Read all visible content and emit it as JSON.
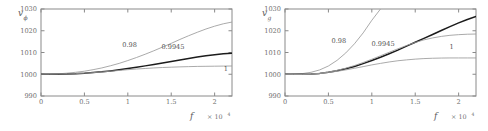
{
  "figure": {
    "panel_count": 2
  },
  "chart_data": [
    {
      "type": "line",
      "panel": "left",
      "title": "",
      "ylabel": "v",
      "ylabel_sub": "ϕ",
      "xlabel": "f",
      "x_exponent_prefix": "× 10",
      "x_exponent_power": "4",
      "xlim": [
        0,
        2.2
      ],
      "ylim": [
        990,
        1030
      ],
      "xticks": [
        0,
        0.5,
        1,
        1.5,
        2
      ],
      "xticklabels": [
        "0",
        "0.5",
        "1",
        "1.5",
        "2"
      ],
      "yticks": [
        990,
        1000,
        1010,
        1020,
        1030
      ],
      "yticklabels": [
        "990",
        "1000",
        "1010",
        "1020",
        "1030"
      ],
      "grid": false,
      "legend_position": "inline-annotations",
      "series": [
        {
          "name": "0.98",
          "style": "thin",
          "label": "0.98",
          "label_x": 1.02,
          "label_y": 1012.6,
          "x": [
            0,
            0.1,
            0.2,
            0.3,
            0.4,
            0.5,
            0.6,
            0.7,
            0.8,
            0.9,
            1.0,
            1.1,
            1.2,
            1.3,
            1.4,
            1.5,
            1.6,
            1.7,
            1.8,
            1.9,
            2.0,
            2.1,
            2.2
          ],
          "values": [
            1000.0,
            1000.05,
            1000.2,
            1000.5,
            1000.9,
            1001.4,
            1002.1,
            1002.9,
            1003.9,
            1005.0,
            1006.3,
            1007.7,
            1009.2,
            1010.8,
            1012.5,
            1014.2,
            1016.0,
            1017.7,
            1019.3,
            1020.8,
            1022.1,
            1023.2,
            1024.0
          ]
        },
        {
          "name": "0.9945",
          "style": "bold",
          "label": "0.9945",
          "label_x": 1.52,
          "label_y": 1011.6,
          "x": [
            0,
            0.1,
            0.2,
            0.3,
            0.4,
            0.5,
            0.6,
            0.7,
            0.8,
            0.9,
            1.0,
            1.1,
            1.2,
            1.3,
            1.4,
            1.5,
            1.6,
            1.7,
            1.8,
            1.9,
            2.0,
            2.1,
            2.2
          ],
          "values": [
            1000.0,
            1000.0,
            1000.05,
            1000.1,
            1000.25,
            1000.45,
            1000.75,
            1001.1,
            1001.55,
            1002.05,
            1002.6,
            1003.2,
            1003.85,
            1004.5,
            1005.2,
            1005.9,
            1006.6,
            1007.25,
            1007.9,
            1008.5,
            1009.0,
            1009.4,
            1009.7
          ]
        },
        {
          "name": "1",
          "style": "thin",
          "label": "1",
          "label_x": 2.13,
          "label_y": 1001.6,
          "x": [
            0,
            0.1,
            0.2,
            0.3,
            0.4,
            0.5,
            0.6,
            0.7,
            0.8,
            0.9,
            1.0,
            1.1,
            1.2,
            1.3,
            1.4,
            1.5,
            1.6,
            1.7,
            1.8,
            1.9,
            2.0,
            2.1,
            2.2
          ],
          "values": [
            1000.0,
            1000.0,
            1000.05,
            1000.15,
            1000.3,
            1000.5,
            1000.75,
            1001.05,
            1001.4,
            1001.75,
            1002.1,
            1002.4,
            1002.65,
            1002.9,
            1003.1,
            1003.25,
            1003.4,
            1003.5,
            1003.6,
            1003.65,
            1003.7,
            1003.75,
            1003.8
          ]
        }
      ]
    },
    {
      "type": "line",
      "panel": "right",
      "title": "",
      "ylabel": "v",
      "ylabel_sub": "g",
      "xlabel": "f",
      "x_exponent_prefix": "× 10",
      "x_exponent_power": "4",
      "xlim": [
        0,
        2.2
      ],
      "ylim": [
        990,
        1030
      ],
      "xticks": [
        0,
        0.5,
        1,
        1.5,
        2
      ],
      "xticklabels": [
        "0",
        "0.5",
        "1",
        "1.5",
        "2"
      ],
      "yticks": [
        990,
        1000,
        1010,
        1020,
        1030
      ],
      "yticklabels": [
        "990",
        "1000",
        "1010",
        "1020",
        "1030"
      ],
      "grid": false,
      "legend_position": "inline-annotations",
      "series": [
        {
          "name": "0.98",
          "style": "thin",
          "label": "0.98",
          "label_x": 0.62,
          "label_y": 1014.2,
          "x": [
            0,
            0.1,
            0.2,
            0.3,
            0.4,
            0.5,
            0.6,
            0.7,
            0.8,
            0.9,
            1.0,
            1.1,
            1.15
          ],
          "values": [
            1000.0,
            1000.05,
            1000.3,
            1000.9,
            1002.0,
            1003.8,
            1006.4,
            1009.8,
            1014.0,
            1019.0,
            1024.8,
            1030.0,
            1032.0
          ]
        },
        {
          "name": "0.9945",
          "style": "bold",
          "label": "0.9945",
          "label_x": 1.13,
          "label_y": 1012.8,
          "x": [
            0,
            0.1,
            0.2,
            0.3,
            0.4,
            0.5,
            0.6,
            0.7,
            0.8,
            0.9,
            1.0,
            1.1,
            1.2,
            1.3,
            1.4,
            1.5,
            1.6,
            1.7,
            1.8,
            1.9,
            2.0,
            2.1,
            2.2
          ],
          "values": [
            1000.0,
            999.95,
            999.95,
            1000.1,
            1000.4,
            1000.9,
            1001.6,
            1002.5,
            1003.6,
            1004.9,
            1006.3,
            1007.8,
            1009.4,
            1011.1,
            1012.9,
            1014.7,
            1016.5,
            1018.3,
            1020.1,
            1021.9,
            1023.6,
            1025.2,
            1026.6
          ]
        },
        {
          "name": "1",
          "style": "thin",
          "label": "1",
          "label_x": 1.92,
          "label_y": 1011.6,
          "x": [
            0,
            0.1,
            0.2,
            0.3,
            0.4,
            0.5,
            0.6,
            0.7,
            0.8,
            0.9,
            1.0,
            1.1,
            1.2,
            1.3,
            1.4,
            1.5,
            1.6,
            1.7,
            1.8,
            1.9,
            2.0,
            2.1,
            2.2
          ],
          "values": [
            1000.0,
            999.95,
            999.95,
            1000.1,
            1000.35,
            1000.8,
            1001.35,
            1002.0,
            1002.75,
            1003.5,
            1004.3,
            1005.0,
            1005.65,
            1006.2,
            1006.6,
            1006.95,
            1007.2,
            1007.35,
            1007.45,
            1007.5,
            1007.5,
            1007.5,
            1007.5
          ]
        },
        {
          "name": "upper-secondary",
          "style": "thin",
          "label": "",
          "label_x": null,
          "label_y": null,
          "x": [
            0,
            0.1,
            0.2,
            0.3,
            0.4,
            0.5,
            0.6,
            0.7,
            0.8,
            0.9,
            1.0,
            1.1,
            1.2,
            1.3,
            1.4,
            1.5,
            1.6,
            1.7,
            1.8,
            1.9,
            2.0,
            2.1,
            2.2
          ],
          "values": [
            1000.0,
            999.95,
            999.95,
            1000.1,
            1000.45,
            1001.0,
            1001.8,
            1002.8,
            1004.0,
            1005.4,
            1006.9,
            1008.5,
            1010.1,
            1011.7,
            1013.2,
            1014.6,
            1015.8,
            1016.7,
            1017.4,
            1017.9,
            1018.2,
            1018.4,
            1018.5
          ]
        }
      ]
    }
  ]
}
